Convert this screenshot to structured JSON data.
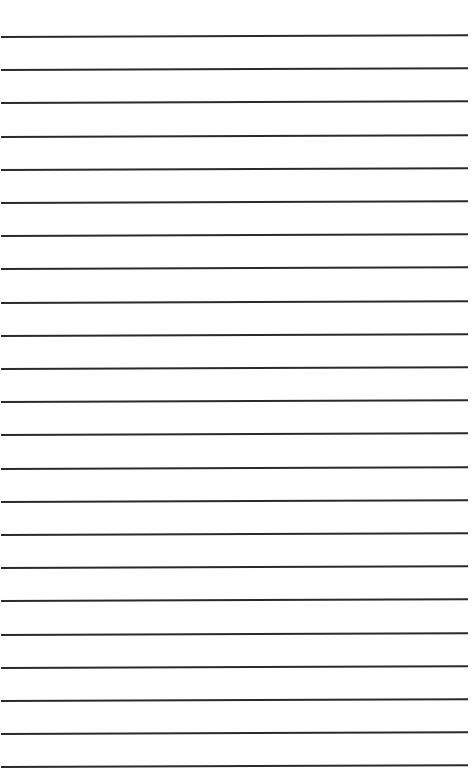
{
  "page": {
    "type": "lined-paper",
    "background_color": "#ffffff",
    "line_color": "#2a2a2a",
    "line_count": 23,
    "first_line_y": 36,
    "line_spacing": 33.2
  }
}
